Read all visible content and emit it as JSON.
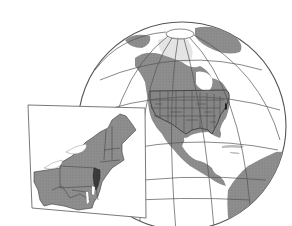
{
  "figure": {
    "type": "locator-map",
    "background": "#ffffff",
    "colors": {
      "ocean": "#ffffff",
      "land": "#8c8c8c",
      "land_light": "#b4b4b4",
      "ice": "#e6e6e6",
      "highlight_state": "#3c3c3c",
      "graticule": "#555555",
      "borders": "#3a3a3a",
      "frame": "#6a6a6a"
    },
    "globe": {
      "center": [
        182,
        126
      ],
      "radius": 104,
      "region_shown": "North America",
      "states_outlined": "United States (contiguous)"
    },
    "inset": {
      "region_shown": "Northeastern United States",
      "highlighted_state": "New Jersey",
      "neighbors_shown": [
        "Maine",
        "New Hampshire",
        "Vermont",
        "Massachusetts",
        "Rhode Island",
        "Connecticut",
        "New York",
        "Pennsylvania",
        "Ohio",
        "West Virginia",
        "Maryland",
        "Delaware",
        "Virginia"
      ]
    }
  }
}
